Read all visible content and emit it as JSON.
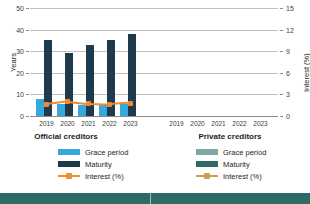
{
  "chart_data": {
    "type": "bar",
    "title": "",
    "categories": [
      "2019",
      "2020",
      "2021",
      "2022",
      "2023"
    ],
    "ylabel": "Years",
    "y2label": "Interest (%)",
    "xlabel": "",
    "ylim": [
      0,
      50
    ],
    "y2lim": [
      0,
      15
    ],
    "yticks": [
      "0",
      "10",
      "20",
      "30",
      "40",
      "50"
    ],
    "y2ticks": [
      "0",
      "3",
      "6",
      "9",
      "12",
      "15"
    ],
    "grid": true,
    "legend_position": "bottom",
    "panels": [
      {
        "name": "Official creditors",
        "series": [
          {
            "name": "Grace period",
            "axis": "left",
            "unit": "years",
            "color": "#35a8dc",
            "values": [
              8.0,
              5.5,
              5.0,
              5.5,
              5.5
            ]
          },
          {
            "name": "Maturity",
            "axis": "left",
            "unit": "years",
            "color": "#1f3a4d",
            "values": [
              35.0,
              29.0,
              33.0,
              35.0,
              38.0
            ]
          },
          {
            "name": "Interest (%)",
            "axis": "right",
            "unit": "percent",
            "color": "#f08a33",
            "values": [
              1.6,
              2.0,
              1.7,
              1.6,
              1.8
            ]
          }
        ]
      },
      {
        "name": "Private creditors",
        "series": [
          {
            "name": "Grace period",
            "axis": "left",
            "unit": "years",
            "color": "#7fa8a4",
            "values": [
              null,
              null,
              null,
              null,
              null
            ]
          },
          {
            "name": "Maturity",
            "axis": "left",
            "unit": "years",
            "color": "#2f6b66",
            "values": [
              null,
              null,
              null,
              null,
              null
            ]
          },
          {
            "name": "Interest (%)",
            "axis": "right",
            "unit": "percent",
            "color": "#c9a44c",
            "values": [
              null,
              null,
              null,
              null,
              null
            ]
          }
        ]
      }
    ]
  },
  "axes": {
    "left_title": "Years",
    "right_title": "Interest (%)",
    "left_ticks": [
      "50",
      "40",
      "30",
      "20",
      "10",
      "0"
    ],
    "right_ticks": [
      "15",
      "12",
      "9",
      "6",
      "3",
      "0"
    ]
  },
  "panel_titles": {
    "official": "Official creditors",
    "private": "Private creditors"
  },
  "legend": {
    "official": {
      "grace": "Grace period",
      "maturity": "Maturity",
      "interest": "Interest (%)"
    },
    "private": {
      "grace": "Grace period",
      "maturity": "Maturity",
      "interest": "Interest (%)"
    }
  },
  "xlabels": [
    "2019",
    "2020",
    "2021",
    "2022",
    "2023"
  ]
}
